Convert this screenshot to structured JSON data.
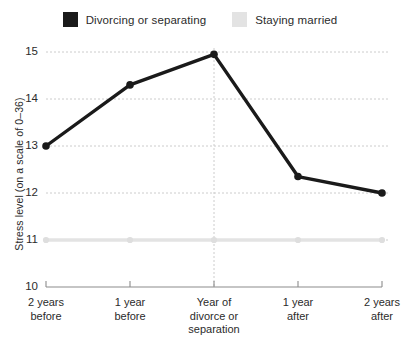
{
  "legend": {
    "entries": [
      {
        "label": "Divorcing or separating",
        "color": "#1a1a1a",
        "swatch_name": "legend-swatch-divorcing"
      },
      {
        "label": "Staying married",
        "color": "#e3e3e3",
        "swatch_name": "legend-swatch-married"
      }
    ]
  },
  "axes": {
    "y_title": "Stress level (on a scale of 0–36)",
    "y_ticks": [
      "15",
      "14",
      "13",
      "12",
      "11",
      "10"
    ],
    "x_tick_lines": [
      [
        "2 years",
        "before"
      ],
      [
        "1 year",
        "before"
      ],
      [
        "Year of",
        "divorce or",
        "separation"
      ],
      [
        "1 year",
        "after"
      ],
      [
        "2 years",
        "after"
      ]
    ]
  },
  "colors": {
    "dark_series": "#1a1a1a",
    "light_series": "#e3e3e3",
    "gridline": "#cccccc",
    "axis_line": "#8c8c8c",
    "background": "#ffffff",
    "text": "#2b2b2b"
  },
  "chart_data": {
    "type": "line",
    "title": "",
    "xlabel": "",
    "ylabel": "Stress level (on a scale of 0–36)",
    "categories": [
      "2 years before",
      "1 year before",
      "Year of divorce or separation",
      "1 year after",
      "2 years after"
    ],
    "series": [
      {
        "name": "Divorcing or separating",
        "color": "#1a1a1a",
        "values": [
          13.0,
          14.3,
          14.95,
          12.35,
          12.0
        ],
        "markers": true
      },
      {
        "name": "Staying married",
        "color": "#e3e3e3",
        "values": [
          11.0,
          11.0,
          11.0,
          11.0,
          11.0
        ],
        "markers": true
      }
    ],
    "ylim": [
      10,
      15
    ],
    "yticks": [
      10,
      11,
      12,
      13,
      14,
      15
    ],
    "grid": "horizontal-dashed-plus-center-vertical-dashed",
    "legend_position": "top-center"
  }
}
